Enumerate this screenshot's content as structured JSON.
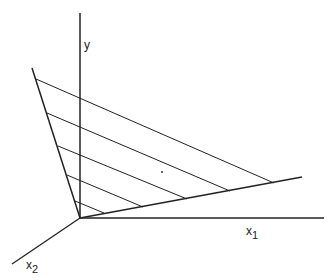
{
  "diagram": {
    "origin": [
      80,
      218
    ],
    "axes": {
      "y": {
        "label": "y",
        "end": [
          80,
          13
        ],
        "label_pos": [
          84,
          38
        ]
      },
      "x1": {
        "label": "x",
        "sub": "1",
        "end": [
          324,
          218
        ],
        "label_pos": [
          246,
          224
        ]
      },
      "x2": {
        "label": "x",
        "sub": "2",
        "end": [
          12,
          264
        ],
        "label_pos": [
          26,
          258
        ]
      }
    },
    "boundary_rays": [
      {
        "name": "left-ray",
        "end": [
          32,
          68
        ]
      },
      {
        "name": "right-ray",
        "end": [
          302,
          177
        ]
      }
    ],
    "hatch_lines": [
      {
        "from": [
          36,
          79
        ],
        "to": [
          274,
          183
        ]
      },
      {
        "from": [
          47,
          113
        ],
        "to": [
          230,
          191
        ]
      },
      {
        "from": [
          58,
          146
        ],
        "to": [
          187,
          199
        ]
      },
      {
        "from": [
          67,
          175
        ],
        "to": [
          143,
          207
        ]
      },
      {
        "from": [
          75,
          201
        ],
        "to": [
          104,
          213
        ]
      }
    ],
    "dot": [
      162,
      172
    ],
    "colors": {
      "line": "#222222",
      "background": "#ffffff"
    }
  }
}
